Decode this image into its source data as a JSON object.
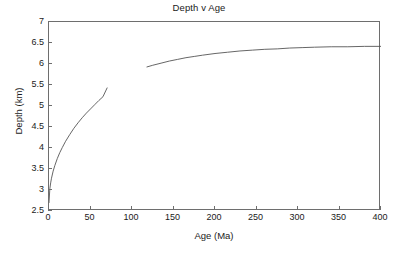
{
  "chart_data": {
    "type": "line",
    "title": "Depth v Age",
    "xlabel": "Age (Ma)",
    "ylabel": "Depth (km)",
    "xlim": [
      0,
      400
    ],
    "ylim": [
      2.5,
      7
    ],
    "xticks": [
      0,
      50,
      100,
      150,
      200,
      250,
      300,
      350,
      400
    ],
    "xtick_labels": [
      "0",
      "50",
      "100",
      "150",
      "200",
      "250",
      "300",
      "350",
      "400"
    ],
    "yticks": [
      2.5,
      3,
      3.5,
      4,
      4.5,
      5,
      5.5,
      6,
      6.5,
      7
    ],
    "ytick_labels": [
      "2.5",
      "3",
      "3.5",
      "4",
      "4.5",
      "5",
      "5.5",
      "6",
      "6.5",
      "7"
    ],
    "grid": false,
    "legend": "none",
    "line_color": "#555555",
    "axis_color": "#6e6e6e",
    "background": "#ffffff",
    "series": [
      {
        "name": "half-space cooling",
        "x": [
          0,
          1,
          2,
          3,
          5,
          7,
          10,
          13,
          16,
          20,
          25,
          30,
          35,
          40,
          45,
          50,
          55,
          60,
          65,
          70
        ],
        "y": [
          2.7,
          3.03,
          3.17,
          3.28,
          3.45,
          3.58,
          3.75,
          3.89,
          4.01,
          4.16,
          4.32,
          4.47,
          4.6,
          4.72,
          4.83,
          4.93,
          5.03,
          5.13,
          5.22,
          5.43
        ]
      },
      {
        "name": "plate model",
        "x": [
          118,
          125,
          135,
          145,
          155,
          165,
          175,
          185,
          200,
          215,
          230,
          245,
          260,
          275,
          290,
          305,
          320,
          340,
          360,
          380,
          400
        ],
        "y": [
          5.93,
          5.97,
          6.02,
          6.07,
          6.11,
          6.15,
          6.18,
          6.21,
          6.25,
          6.28,
          6.31,
          6.33,
          6.35,
          6.36,
          6.38,
          6.39,
          6.4,
          6.41,
          6.41,
          6.42,
          6.42
        ]
      }
    ]
  }
}
